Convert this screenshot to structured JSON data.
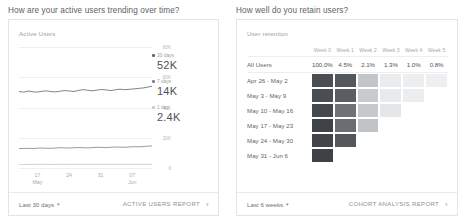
{
  "panels": {
    "left": {
      "title": "How are your active users trending over time?",
      "card_label": "Active Users",
      "footer": {
        "range_label": "Last 30 days",
        "caret": "▾",
        "report_label": "ACTIVE USERS REPORT",
        "chevron": "›"
      }
    },
    "right": {
      "title": "How well do you retain users?",
      "card_label": "User retention",
      "footer": {
        "range_label": "Last 6 weeks",
        "caret": "▾",
        "report_label": "COHORT ANALYSIS REPORT",
        "chevron": "›"
      }
    }
  },
  "chart_data": [
    {
      "type": "line",
      "title": "Active Users",
      "xlabel": "",
      "ylabel": "",
      "ylim": [
        0,
        80000
      ],
      "grid": true,
      "ytick_labels": [
        "80K",
        "60K",
        "40K",
        "20K",
        "0"
      ],
      "ytick_values": [
        80000,
        60000,
        40000,
        20000,
        0
      ],
      "xtick_labels": [
        [
          "17",
          "May"
        ],
        [
          "24",
          ""
        ],
        [
          "31",
          ""
        ],
        [
          "07",
          "Jun"
        ]
      ],
      "legend_position": "right",
      "series": [
        {
          "name": "30 days",
          "value_label": "52K",
          "value": 52000,
          "color": "#5f6368",
          "values": [
            50600,
            50100,
            50900,
            50400,
            50200,
            50700,
            51000,
            50500,
            50300,
            50800,
            51200,
            50900,
            50600,
            51300,
            51800,
            51400,
            51000,
            51500,
            51900,
            51600,
            51200,
            51700,
            52100,
            51800,
            52000,
            52300,
            52600,
            52900,
            53400,
            54100
          ]
        },
        {
          "name": "7 days",
          "value_label": "14K",
          "value": 14000,
          "color": "#7c8186",
          "values": [
            12800,
            12900,
            13000,
            12900,
            13100,
            13200,
            13100,
            13000,
            13200,
            13400,
            13300,
            13200,
            13400,
            13500,
            13400,
            13300,
            13500,
            13700,
            13600,
            13500,
            13700,
            13900,
            13800,
            13700,
            13900,
            14100,
            14000,
            14200,
            14400,
            14600
          ]
        },
        {
          "name": "1 day",
          "value_label": "2.4K",
          "value": 2400,
          "color": "#c5c9cd",
          "values": [
            2350,
            2380,
            2320,
            2400,
            2360,
            2420,
            2390,
            2340,
            2410,
            2450,
            2400,
            2360,
            2430,
            2470,
            2410,
            2370,
            2440,
            2480,
            2420,
            2380,
            2450,
            2490,
            2430,
            2400,
            2460,
            2500,
            2440,
            2410,
            2470,
            2510
          ]
        }
      ]
    },
    {
      "type": "heatmap",
      "title": "User retention",
      "columns": [
        "Week 0",
        "Week 1",
        "Week 2",
        "Week 3",
        "Week 4",
        "Week 5"
      ],
      "all_users_row": {
        "label": "All Users",
        "values": [
          "100.0%",
          "4.5%",
          "2.1%",
          "1.3%",
          "1.0%",
          "0.8%"
        ],
        "numeric": [
          100.0,
          4.5,
          2.1,
          1.3,
          1.0,
          0.8
        ]
      },
      "rows": [
        {
          "label": "Apr 26 - May 2",
          "cells": [
            "#4a4e52",
            "#53575b",
            "#c3c6c9",
            "#e9ebec",
            "#eceeef",
            "#edeff0"
          ]
        },
        {
          "label": "May 3 - May 9",
          "cells": [
            "#4a4e52",
            "#5a5e62",
            "#c8cbce",
            "#e8eaeb",
            "#ebedee",
            null
          ]
        },
        {
          "language": "",
          "label": "May 10 - May 16",
          "cells": [
            "#44484c",
            "#6e7276",
            "#c6c9cc",
            "#e4e6e7",
            null,
            null
          ]
        },
        {
          "label": "May 17 - May 23",
          "cells": [
            "#3f4347",
            "#6a6e72",
            "#c1c4c7",
            null,
            null,
            null
          ]
        },
        {
          "label": "May 24 - May 30",
          "cells": [
            "#434448",
            "#54585c",
            null,
            null,
            null,
            null
          ]
        },
        {
          "label": "May 31 - Jun 6",
          "cells": [
            "#3e4246",
            null,
            null,
            null,
            null,
            null
          ]
        }
      ]
    }
  ]
}
